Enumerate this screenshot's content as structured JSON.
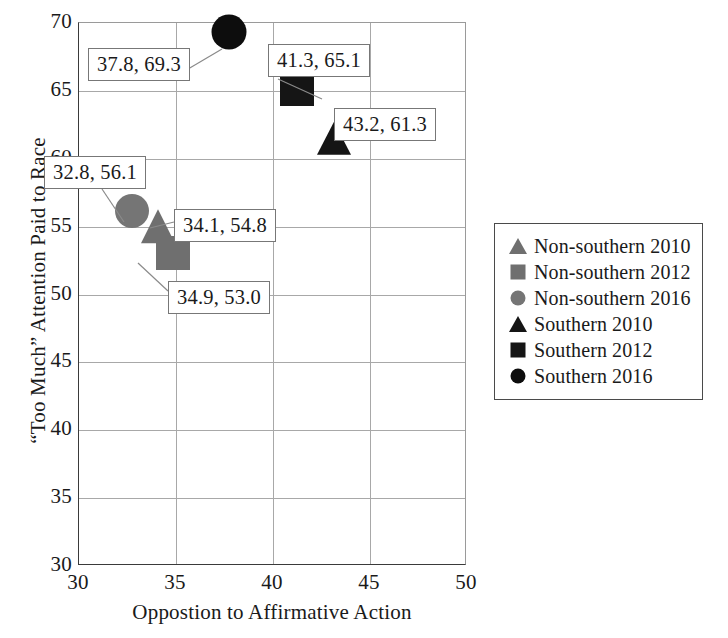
{
  "chart_data": {
    "type": "scatter",
    "title": "",
    "xlabel": "Oppostion to Affirmative Action",
    "ylabel": "“Too Much” Attention Paid to Race",
    "xlim": [
      30,
      50
    ],
    "ylim": [
      30,
      70
    ],
    "xticks": [
      30,
      35,
      40,
      45,
      50
    ],
    "yticks": [
      30,
      35,
      40,
      45,
      50,
      55,
      60,
      65,
      70
    ],
    "xtick_labels": [
      "30",
      "35",
      "40",
      "45",
      "50"
    ],
    "ytick_labels": [
      "30",
      "35",
      "40",
      "45",
      "50",
      "55",
      "60",
      "65",
      "70"
    ],
    "grid": true,
    "legend_position": "right",
    "series": [
      {
        "name": "Non-southern 2010",
        "marker": "triangle",
        "color": "#6f6f6f",
        "points": [
          {
            "x": 34.1,
            "y": 54.8,
            "label": "34.1, 54.8"
          }
        ]
      },
      {
        "name": "Non-southern 2012",
        "marker": "square",
        "color": "#6f6f6f",
        "points": [
          {
            "x": 34.9,
            "y": 53.0,
            "label": "34.9, 53.0"
          }
        ]
      },
      {
        "name": "Non-southern 2016",
        "marker": "circle",
        "color": "#757575",
        "points": [
          {
            "x": 32.8,
            "y": 56.1,
            "label": "32.8, 56.1"
          }
        ]
      },
      {
        "name": "Southern 2010",
        "marker": "triangle",
        "color": "#151515",
        "points": [
          {
            "x": 43.2,
            "y": 61.3,
            "label": "43.2, 61.3"
          }
        ]
      },
      {
        "name": "Southern 2012",
        "marker": "square",
        "color": "#151515",
        "points": [
          {
            "x": 41.3,
            "y": 65.1,
            "label": "41.3, 65.1"
          }
        ]
      },
      {
        "name": "Southern 2016",
        "marker": "circle",
        "color": "#0d0d0d",
        "points": [
          {
            "x": 37.8,
            "y": 69.3,
            "label": "37.8, 69.3"
          }
        ]
      }
    ],
    "annotations": [
      {
        "text": "37.8, 69.3",
        "for": "Southern 2016"
      },
      {
        "text": "41.3, 65.1",
        "for": "Southern 2012"
      },
      {
        "text": "43.2, 61.3",
        "for": "Southern 2010"
      },
      {
        "text": "32.8, 56.1",
        "for": "Non-southern 2016"
      },
      {
        "text": "34.1, 54.8",
        "for": "Non-southern 2010"
      },
      {
        "text": "34.9, 53.0",
        "for": "Non-southern 2012"
      }
    ]
  },
  "legend": {
    "entries": [
      {
        "label": "Non-southern 2010",
        "marker": "triangle",
        "color": "#6f6f6f"
      },
      {
        "label": "Non-southern 2012",
        "marker": "square",
        "color": "#6f6f6f"
      },
      {
        "label": "Non-southern 2016",
        "marker": "circle",
        "color": "#757575"
      },
      {
        "label": "Southern 2010",
        "marker": "triangle",
        "color": "#151515"
      },
      {
        "label": "Southern 2012",
        "marker": "square",
        "color": "#151515"
      },
      {
        "label": "Southern 2016",
        "marker": "circle",
        "color": "#0d0d0d"
      }
    ]
  },
  "colors": {
    "axis": "#3a3a3a",
    "grid": "#a8a8a8",
    "text": "#1a1a1a",
    "callout_border": "#777777",
    "background": "#ffffff"
  }
}
